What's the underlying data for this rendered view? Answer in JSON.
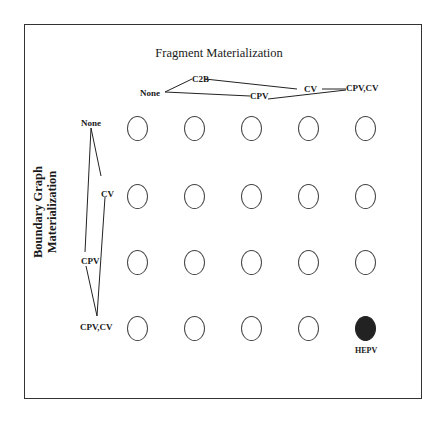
{
  "title": "Fragment Materialization",
  "y_axis_title_line1": "Boundary Graph",
  "y_axis_title_line2": "Materialization",
  "fragment_options": [
    "None",
    "C2B",
    "CPV",
    "CV",
    "CPV,CV"
  ],
  "boundary_options": [
    "None",
    "CV",
    "CPV",
    "CPV,CV"
  ],
  "highlight": {
    "label": "HEPV",
    "row": 3,
    "col": 4,
    "color": "#222222"
  },
  "grid": {
    "rows": 4,
    "cols": 5
  }
}
